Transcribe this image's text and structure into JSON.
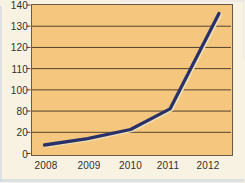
{
  "chart_data": {
    "type": "line",
    "title": "",
    "x_categories": [
      "2008",
      "2009",
      "2010",
      "2011",
      "2012"
    ],
    "series": [
      {
        "name": "trend-line",
        "values": [
          8,
          14,
          28,
          82,
          136
        ]
      }
    ],
    "y_tick_labels_top_to_bottom": [
      "140",
      "130",
      "120",
      "110",
      "100",
      "80",
      "20",
      "0"
    ],
    "y_axis_scale_note": "broken non-uniform scale: gridlines evenly spaced but values jump 0, 20, 80, 100, 110, 120, 130, 140",
    "grid": "horizontal gridlines on",
    "legend": "none",
    "xlabel": "",
    "ylabel": ""
  },
  "colors": {
    "page_bg": "#f8f2e3",
    "plot_bg": "#f5c77e",
    "plot_border": "#6a5a45",
    "grid_line": "#54402a",
    "data_line": "#2a3168",
    "line_highlight": "#ece0ba",
    "label_text": "#33302b",
    "scan_edge": "#c9d4e2"
  }
}
